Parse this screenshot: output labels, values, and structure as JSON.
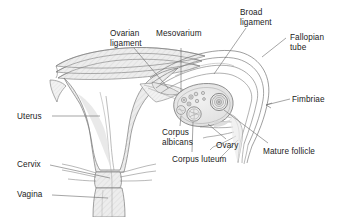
{
  "diagram": {
    "background_color": "#ffffff",
    "line_color": "#6e6e6e",
    "fill_color": "#e8e8e8",
    "text_color": "#1b1b1b",
    "labels": [
      {
        "id": "ovarian-ligament",
        "text": "Ovarian\nligament",
        "x": 110,
        "y": 29,
        "align": "left"
      },
      {
        "id": "mesovarium",
        "text": "Mesovarium",
        "x": 156,
        "y": 29,
        "align": "left"
      },
      {
        "id": "broad-ligament",
        "text": "Broad\nligament",
        "x": 240,
        "y": 8,
        "align": "left"
      },
      {
        "id": "fallopian-tube",
        "text": "Fallopian\ntube",
        "x": 290,
        "y": 33,
        "align": "left"
      },
      {
        "id": "fimbriae",
        "text": "Fimbriae",
        "x": 292,
        "y": 95,
        "align": "left"
      },
      {
        "id": "mature-follicle",
        "text": "Mature follicle",
        "x": 263,
        "y": 147,
        "align": "left"
      },
      {
        "id": "ovary",
        "text": "Ovary",
        "x": 216,
        "y": 141,
        "align": "left"
      },
      {
        "id": "corpus-luteum",
        "text": "Corpus luteum",
        "x": 172,
        "y": 155,
        "align": "left"
      },
      {
        "id": "corpus-albicans",
        "text": "Corpus\nalbicans",
        "x": 162,
        "y": 128,
        "align": "left"
      },
      {
        "id": "uterus",
        "text": "Uterus",
        "x": 17,
        "y": 112,
        "align": "left"
      },
      {
        "id": "cervix",
        "text": "Cervix",
        "x": 17,
        "y": 160,
        "align": "left"
      },
      {
        "id": "vagina",
        "text": "Vagina",
        "x": 17,
        "y": 190,
        "align": "left"
      }
    ],
    "structures": [
      "uterus-body",
      "cervix",
      "vagina",
      "broad-ligament-sheets",
      "ovarian-ligament",
      "mesovarium",
      "fallopian-tube",
      "fimbriae",
      "ovary",
      "mature-follicle",
      "corpus-luteum",
      "corpus-albicans",
      "primordial-follicles"
    ]
  }
}
